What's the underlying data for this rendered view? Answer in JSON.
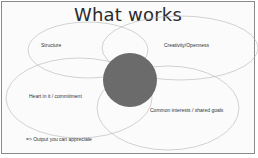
{
  "slide": {
    "title": "What works",
    "circles": [
      {
        "label": "Structure"
      },
      {
        "label": "Creativity/Openness"
      },
      {
        "label": "Heart in it / commitment"
      },
      {
        "label": "Common interests / shared goals"
      }
    ],
    "center_color": "#6b6b6b",
    "footer": "=> Output you can appreciate"
  }
}
